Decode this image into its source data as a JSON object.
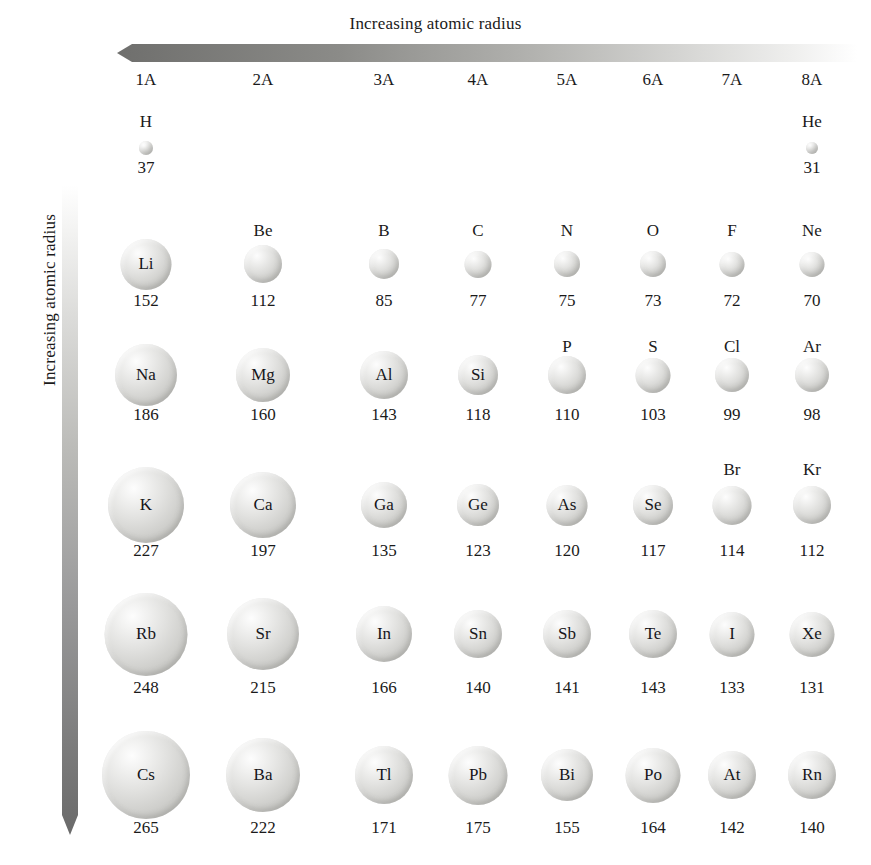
{
  "figure": {
    "top_arrow_label": "Increasing atomic radius",
    "side_arrow_label": "Increasing atomic radius",
    "arrow_dark_color": "#7a7a78",
    "arrow_light_color": "#f2f2f1",
    "sphere_color": "#d5d5d2",
    "text_color": "#1a1a1a"
  },
  "group_headers": [
    {
      "label": "1A"
    },
    {
      "label": "2A"
    },
    {
      "label": "3A"
    },
    {
      "label": "4A"
    },
    {
      "label": "5A"
    },
    {
      "label": "6A"
    },
    {
      "label": "7A"
    },
    {
      "label": "8A"
    }
  ],
  "chart_data": {
    "type": "table",
    "title": "Increasing atomic radius",
    "xlabel": "Increasing atomic radius",
    "ylabel": "Increasing atomic radius",
    "unit": "pm",
    "categories": [
      "1A",
      "2A",
      "3A",
      "4A",
      "5A",
      "6A",
      "7A",
      "8A"
    ],
    "rows": [
      {
        "period": 1,
        "cells": [
          {
            "symbol": "H",
            "radius": 37,
            "group": "1A"
          },
          null,
          null,
          null,
          null,
          null,
          null,
          {
            "symbol": "He",
            "radius": 31,
            "group": "8A"
          }
        ]
      },
      {
        "period": 2,
        "cells": [
          {
            "symbol": "Li",
            "radius": 152,
            "group": "1A"
          },
          {
            "symbol": "Be",
            "radius": 112,
            "group": "2A"
          },
          {
            "symbol": "B",
            "radius": 85,
            "group": "3A"
          },
          {
            "symbol": "C",
            "radius": 77,
            "group": "4A"
          },
          {
            "symbol": "N",
            "radius": 75,
            "group": "5A"
          },
          {
            "symbol": "O",
            "radius": 73,
            "group": "6A"
          },
          {
            "symbol": "F",
            "radius": 72,
            "group": "7A"
          },
          {
            "symbol": "Ne",
            "radius": 70,
            "group": "8A"
          }
        ]
      },
      {
        "period": 3,
        "cells": [
          {
            "symbol": "Na",
            "radius": 186,
            "group": "1A"
          },
          {
            "symbol": "Mg",
            "radius": 160,
            "group": "2A"
          },
          {
            "symbol": "Al",
            "radius": 143,
            "group": "3A"
          },
          {
            "symbol": "Si",
            "radius": 118,
            "group": "4A"
          },
          {
            "symbol": "P",
            "radius": 110,
            "group": "5A"
          },
          {
            "symbol": "S",
            "radius": 103,
            "group": "6A"
          },
          {
            "symbol": "Cl",
            "radius": 99,
            "group": "7A"
          },
          {
            "symbol": "Ar",
            "radius": 98,
            "group": "8A"
          }
        ]
      },
      {
        "period": 4,
        "cells": [
          {
            "symbol": "K",
            "radius": 227,
            "group": "1A"
          },
          {
            "symbol": "Ca",
            "radius": 197,
            "group": "2A"
          },
          {
            "symbol": "Ga",
            "radius": 135,
            "group": "3A"
          },
          {
            "symbol": "Ge",
            "radius": 123,
            "group": "4A"
          },
          {
            "symbol": "As",
            "radius": 120,
            "group": "5A"
          },
          {
            "symbol": "Se",
            "radius": 117,
            "group": "6A"
          },
          {
            "symbol": "Br",
            "radius": 114,
            "group": "7A"
          },
          {
            "symbol": "Kr",
            "radius": 112,
            "group": "8A"
          }
        ]
      },
      {
        "period": 5,
        "cells": [
          {
            "symbol": "Rb",
            "radius": 248,
            "group": "1A"
          },
          {
            "symbol": "Sr",
            "radius": 215,
            "group": "2A"
          },
          {
            "symbol": "In",
            "radius": 166,
            "group": "3A"
          },
          {
            "symbol": "Sn",
            "radius": 140,
            "group": "4A"
          },
          {
            "symbol": "Sb",
            "radius": 141,
            "group": "5A"
          },
          {
            "symbol": "Te",
            "radius": 143,
            "group": "6A"
          },
          {
            "symbol": "I",
            "radius": 133,
            "group": "7A"
          },
          {
            "symbol": "Xe",
            "radius": 131,
            "group": "8A"
          }
        ]
      },
      {
        "period": 6,
        "cells": [
          {
            "symbol": "Cs",
            "radius": 265,
            "group": "1A"
          },
          {
            "symbol": "Ba",
            "radius": 222,
            "group": "2A"
          },
          {
            "symbol": "Tl",
            "radius": 171,
            "group": "3A"
          },
          {
            "symbol": "Pb",
            "radius": 175,
            "group": "4A"
          },
          {
            "symbol": "Bi",
            "radius": 155,
            "group": "5A"
          },
          {
            "symbol": "Po",
            "radius": 164,
            "group": "6A"
          },
          {
            "symbol": "At",
            "radius": 142,
            "group": "7A"
          },
          {
            "symbol": "Rn",
            "radius": 140,
            "group": "8A"
          }
        ]
      }
    ]
  }
}
